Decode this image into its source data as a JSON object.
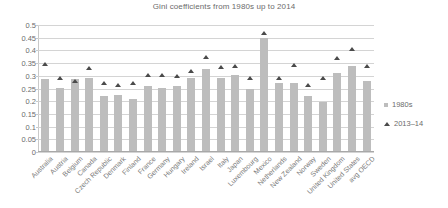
{
  "chart_data": {
    "type": "bar",
    "title": "Gini coefficients from 1980s up to 2014",
    "xlabel": "",
    "ylabel": "",
    "ylim": [
      0,
      0.5
    ],
    "yticks": [
      0,
      0.05,
      0.1,
      0.15,
      0.2,
      0.25,
      0.3,
      0.35,
      0.4,
      0.45,
      0.5
    ],
    "ytick_labels": [
      "0",
      "0.05",
      "0.1",
      "0.15",
      "0.2",
      "0.25",
      "0.3",
      "0.35",
      "0.4",
      "0.45",
      "0.5"
    ],
    "grid": true,
    "legend_position": "right",
    "categories": [
      "Australia",
      "Austria",
      "Belgium",
      "Canada",
      "Czech Republic",
      "Denmark",
      "Finland",
      "France",
      "Germany",
      "Hungary",
      "Ireland",
      "Israel",
      "Italy",
      "Japan",
      "Luxembourg",
      "Mexico",
      "Netherlands",
      "New Zealand",
      "Norway",
      "Sweden",
      "United Kingdom",
      "United States",
      "avg OECD"
    ],
    "series": [
      {
        "name": "1980s",
        "marker": "square",
        "color": "#bdbdbd",
        "values": [
          0.289,
          0.251,
          0.289,
          0.293,
          0.219,
          0.224,
          0.209,
          0.259,
          0.251,
          0.259,
          0.292,
          0.326,
          0.291,
          0.304,
          0.249,
          0.45,
          0.272,
          0.271,
          0.222,
          0.198,
          0.311,
          0.34,
          0.278
        ]
      },
      {
        "name": "2013–14",
        "marker": "triangle",
        "color": "#4a4a4a",
        "values": [
          0.337,
          0.28,
          0.268,
          0.322,
          0.26,
          0.254,
          0.26,
          0.294,
          0.292,
          0.288,
          0.309,
          0.365,
          0.325,
          0.33,
          0.281,
          0.459,
          0.283,
          0.333,
          0.252,
          0.281,
          0.358,
          0.394,
          0.33
        ]
      }
    ]
  },
  "legend": {
    "items": [
      {
        "label": "1980s"
      },
      {
        "label": "2013–14"
      }
    ]
  }
}
